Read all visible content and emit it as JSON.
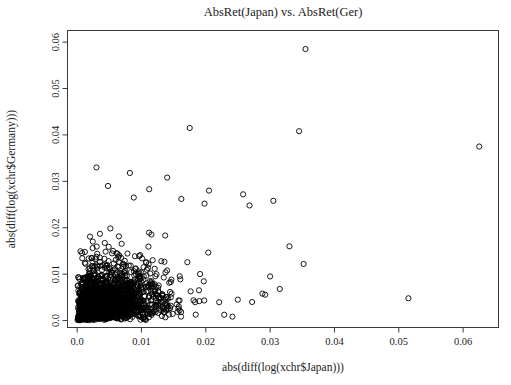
{
  "chart_data": {
    "type": "scatter",
    "title": "AbsRet(Japan) vs. AbsRet(Ger)",
    "xlabel": "abs(diff(log(xchr$Japan)))",
    "ylabel": "abs(diff(log(xchr$Germany)))",
    "xlim": [
      -0.0015,
      0.0655
    ],
    "ylim": [
      -0.0015,
      0.0625
    ],
    "xticks": [
      0.0,
      0.01,
      0.02,
      0.03,
      0.04,
      0.05,
      0.06
    ],
    "xtick_labels": [
      "0.0",
      "0.01",
      "0.02",
      "0.03",
      "0.04",
      "0.05",
      "0.06"
    ],
    "yticks": [
      0.0,
      0.01,
      0.02,
      0.03,
      0.04,
      0.05,
      0.06
    ],
    "ytick_labels": [
      "0.0",
      "0.01",
      "0.02",
      "0.03",
      "0.04",
      "0.05",
      "0.06"
    ],
    "grid": false,
    "legend": false,
    "marker": "open-circle",
    "marker_radius_px": 2.6,
    "marker_color": "#000000",
    "n_points": 2300,
    "distribution": {
      "note": "Dense exponential cluster near origin; absolute daily FX log-return magnitudes, weakly correlated.",
      "x_scale": 0.0048,
      "y_scale": 0.0042,
      "correlation": 0.33,
      "seed": 20240517
    },
    "outliers": [
      [
        0.0355,
        0.0585
      ],
      [
        0.0175,
        0.0415
      ],
      [
        0.0345,
        0.0408
      ],
      [
        0.0625,
        0.0375
      ],
      [
        0.003,
        0.033
      ],
      [
        0.0082,
        0.0318
      ],
      [
        0.014,
        0.0308
      ],
      [
        0.0048,
        0.029
      ],
      [
        0.0112,
        0.0283
      ],
      [
        0.0205,
        0.028
      ],
      [
        0.0258,
        0.0272
      ],
      [
        0.0088,
        0.0265
      ],
      [
        0.0162,
        0.0262
      ],
      [
        0.0305,
        0.0258
      ],
      [
        0.0198,
        0.0252
      ],
      [
        0.0268,
        0.0248
      ],
      [
        0.0515,
        0.0048
      ],
      [
        0.0352,
        0.0122
      ],
      [
        0.033,
        0.016
      ],
      [
        0.03,
        0.0095
      ],
      [
        0.0288,
        0.0058
      ],
      [
        0.0272,
        0.004
      ],
      [
        0.0315,
        0.0068
      ]
    ]
  },
  "axes": {
    "x_axis_name": "x-axis",
    "y_axis_name": "y-axis"
  }
}
